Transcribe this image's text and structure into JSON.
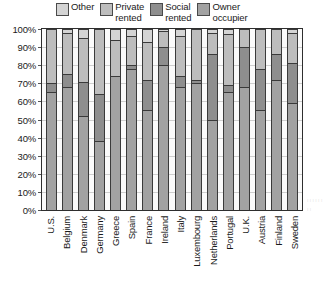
{
  "legend": {
    "position": "top",
    "entries": [
      {
        "label": "Other",
        "swatch_name": "legend-swatch-other",
        "color": "#d4d4d4"
      },
      {
        "label": "Private\nrented",
        "swatch_name": "legend-swatch-private-rented",
        "color": "#bdbdbd"
      },
      {
        "label": "Social\nrented",
        "swatch_name": "legend-swatch-social-rented",
        "color": "#8e8e8e"
      },
      {
        "label": "Owner\noccupier",
        "swatch_name": "legend-swatch-owner-occupier",
        "color": "#a2a2a2"
      }
    ]
  },
  "axis": {
    "y_ticks": [
      "100%",
      "90%",
      "80%",
      "70%",
      "60%",
      "50%",
      "40%",
      "30%",
      "20%",
      "10%",
      "0%"
    ],
    "y_label": "",
    "x_label": ""
  },
  "chart_data": {
    "type": "bar",
    "title": "",
    "subtitle": "",
    "xlabel": "",
    "ylabel": "",
    "ylim": [
      0,
      100
    ],
    "grid": true,
    "stacked": true,
    "stack_total": 100,
    "legend_position": "top",
    "categories": [
      "U.S.",
      "Belgium",
      "Denmark",
      "Germany",
      "Greece",
      "Spain",
      "France",
      "Ireland",
      "Italy",
      "Luxembourg",
      "Netherlands",
      "Portugal",
      "U.K.",
      "Austria",
      "Finland",
      "Sweden"
    ],
    "series": [
      {
        "name": "Owner occupier",
        "color": "#a2a2a2",
        "values": [
          65,
          68,
          52,
          38,
          74,
          78,
          55,
          80,
          68,
          70,
          50,
          65,
          68,
          55,
          72,
          59
        ]
      },
      {
        "name": "Social rented",
        "color": "#8e8e8e",
        "values": [
          5,
          7,
          19,
          26,
          0,
          2,
          17,
          10,
          6,
          2,
          36,
          4,
          22,
          23,
          14,
          22
        ]
      },
      {
        "name": "Private rented",
        "color": "#bdbdbd",
        "values": [
          30,
          23,
          24,
          36,
          20,
          16,
          21,
          9,
          22,
          28,
          12,
          28,
          10,
          22,
          14,
          17
        ]
      },
      {
        "name": "Other",
        "color": "#d4d4d4",
        "values": [
          0,
          2,
          5,
          0,
          6,
          4,
          7,
          1,
          4,
          0,
          2,
          3,
          0,
          0,
          0,
          2
        ]
      }
    ]
  }
}
